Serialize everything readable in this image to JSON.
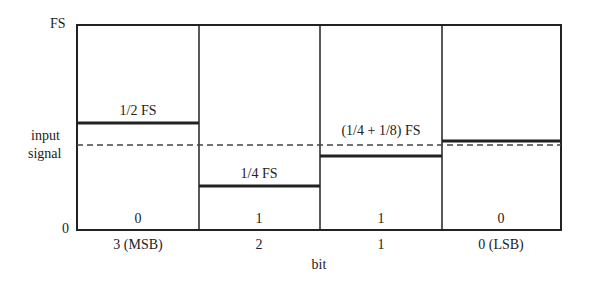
{
  "diagram": {
    "y_axis": {
      "top_label": "FS",
      "bottom_label": "0",
      "input_label_line1": "input",
      "input_label_line2": "signal"
    },
    "x_axis": {
      "title": "bit",
      "ticks": [
        "3 (MSB)",
        "2",
        "1",
        "0 (LSB)"
      ]
    },
    "columns": [
      {
        "bit": "3 (MSB)",
        "threshold_label": "1/2 FS",
        "threshold_fraction": 0.5,
        "result": "0"
      },
      {
        "bit": "2",
        "threshold_label": "1/4 FS",
        "threshold_fraction": 0.25,
        "result": "1"
      },
      {
        "bit": "1",
        "threshold_label": "(1/4 + 1/8) FS",
        "threshold_fraction": 0.375,
        "result": "1"
      },
      {
        "bit": "0 (LSB)",
        "threshold_label": "",
        "threshold_fraction": 0.4375,
        "result": "0"
      }
    ],
    "input_signal_fraction": 0.415
  }
}
